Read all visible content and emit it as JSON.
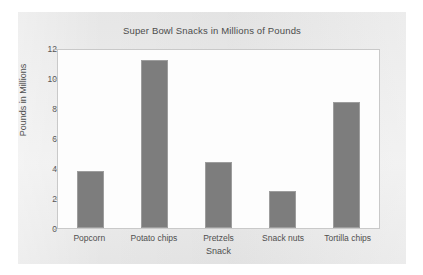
{
  "chart_data": {
    "type": "bar",
    "title": "Super Bowl Snacks in Millions of Pounds",
    "xlabel": "Snack",
    "ylabel": "Pounds in Millions",
    "categories": [
      "Popcorn",
      "Potato chips",
      "Pretzels",
      "Snack nuts",
      "Tortilla chips"
    ],
    "values": [
      3.8,
      11.2,
      4.4,
      2.5,
      8.4
    ],
    "ylim": [
      0,
      12
    ],
    "yticks": [
      12,
      10,
      8,
      6,
      4,
      2,
      0
    ],
    "ytick_labels": [
      "12",
      "10",
      "8",
      "6",
      "4",
      "2",
      "0"
    ],
    "grid": false,
    "legend": false,
    "series": [
      {
        "name": "Pounds in Millions",
        "values": [
          3.8,
          11.2,
          4.4,
          2.5,
          8.4
        ],
        "color": "#7d7d7d"
      }
    ],
    "colors": {
      "bar_fill": "#7d7d7d",
      "bar_border": "#9d9d9d",
      "plot_background": "#fdfdfd",
      "panel_background": "#eaeaea",
      "axis": "#c9c9c9",
      "text": "#4f4f4f"
    }
  }
}
